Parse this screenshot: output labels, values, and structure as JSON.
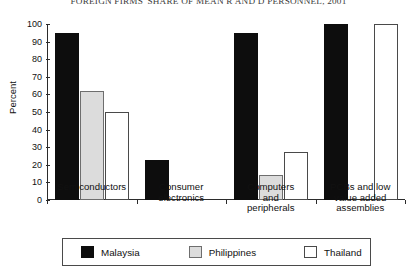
{
  "chart_data": {
    "type": "bar",
    "title": "FOREIGN FIRMS' SHARE OF MEAN R AND D PERSONNEL, 2001",
    "xlabel": "",
    "ylabel": "Percent",
    "ylim": [
      0,
      100
    ],
    "ytick_labels": [
      "0",
      "10",
      "20",
      "30",
      "40",
      "50",
      "60",
      "70",
      "80",
      "90",
      "100"
    ],
    "ytick_values": [
      0,
      10,
      20,
      30,
      40,
      50,
      60,
      70,
      80,
      90,
      100
    ],
    "grid": false,
    "legend_position": "bottom",
    "categories": [
      "Semiconductors",
      "Consumer\nelectronics",
      "Computers\nand\nperipherals",
      "PCBs and low\nvalue added\nassemblies"
    ],
    "category_lines": [
      [
        "Semiconductors"
      ],
      [
        "Consumer",
        "electronics"
      ],
      [
        "Computers",
        "and",
        "peripherals"
      ],
      [
        "PCBs and low",
        "value added",
        "assemblies"
      ]
    ],
    "series": [
      {
        "name": "Malaysia",
        "color": "#0d0d0d",
        "values": [
          95,
          23,
          95,
          100
        ]
      },
      {
        "name": "Philippines",
        "color": "#dcdcdc",
        "values": [
          62,
          null,
          14,
          null
        ]
      },
      {
        "name": "Thailand",
        "color": "#ffffff",
        "values": [
          50,
          null,
          27,
          100
        ]
      }
    ]
  },
  "legend": {
    "items": [
      {
        "label": "Malaysia"
      },
      {
        "label": "Philippines"
      },
      {
        "label": "Thailand"
      }
    ]
  }
}
